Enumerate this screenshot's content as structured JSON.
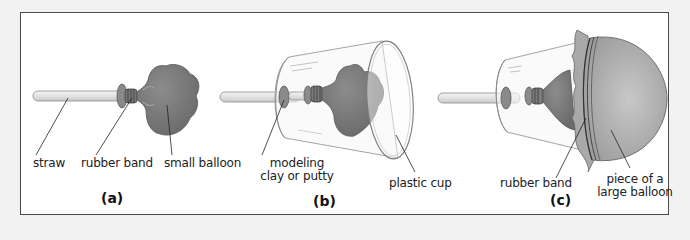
{
  "figure": {
    "panels": [
      {
        "id": "a",
        "caption": "(a)",
        "labels": {
          "straw": "straw",
          "rubber_band": "rubber band",
          "small_balloon": "small balloon"
        }
      },
      {
        "id": "b",
        "caption": "(b)",
        "labels": {
          "clay_line1": "modeling",
          "clay_line2": "clay or putty",
          "plastic_cup": "plastic cup"
        }
      },
      {
        "id": "c",
        "caption": "(c)",
        "labels": {
          "rubber_band": "rubber band",
          "piece_line1": "piece of a",
          "piece_line2": "large balloon"
        }
      }
    ],
    "colors": {
      "background": "#f2f2f2",
      "frame_border": "#4a4a4a",
      "balloon": "#7c7c7c",
      "straw": "#e6e6e6",
      "large_balloon": "#bdbdbd"
    }
  }
}
